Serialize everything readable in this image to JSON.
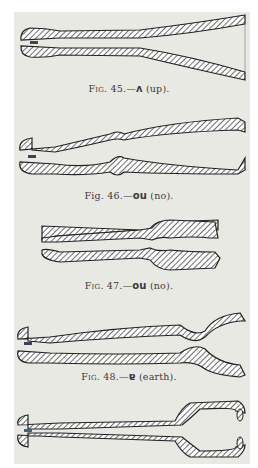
{
  "figures": [
    {
      "number": "45",
      "prefix": "Fig.",
      "symbol": "ʌ",
      "gloss": "(up).",
      "prefix_style": "small-caps"
    },
    {
      "number": "46",
      "prefix": "Fig.",
      "symbol": "ou",
      "gloss": "(no).",
      "prefix_style": "normal"
    },
    {
      "number": "47",
      "prefix": "Fig.",
      "symbol": "ou",
      "gloss": "(no).",
      "prefix_style": "small-caps"
    },
    {
      "number": "48",
      "prefix": "Fig.",
      "symbol": "ɐ",
      "gloss": "(earth).",
      "prefix_style": "small-caps"
    }
  ],
  "colors": {
    "page": "#e9e9e4",
    "border": "#ffffff",
    "ink": "#2a2a2a",
    "hatch": "#555555"
  }
}
